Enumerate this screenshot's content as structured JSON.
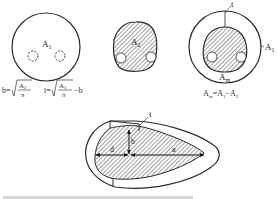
{
  "diagram": {
    "panel1": {
      "area_label": "A",
      "area_sub": "1",
      "formula_b": {
        "lhs": "b=",
        "num": "A",
        "num_sub": "2",
        "den": "π"
      },
      "formula_t": {
        "lhs": "t=",
        "num": "A",
        "num_sub": "1",
        "den": "π",
        "tail": "−b"
      }
    },
    "panel2": {
      "area_label": "A",
      "area_sub": "2"
    },
    "panel3": {
      "thickness_label": "t",
      "outer_label": "A",
      "outer_sub": "1",
      "mid_label": "A",
      "mid_sub": "m",
      "formula": {
        "a": "A",
        "a_sub": "m",
        "eq": "=A",
        "b_sub": "1",
        "minus": "−A",
        "c_sub": "2"
      }
    },
    "panel4": {
      "thickness_label": "t",
      "b_label": "b",
      "d_label": "d",
      "a_label": "a"
    },
    "footer_text": "(bottom text line, cut off / illegible)"
  },
  "colors": {
    "line": "#2a2a2a",
    "hatch": "#555555",
    "background": "#ffffff"
  }
}
